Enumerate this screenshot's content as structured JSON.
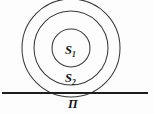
{
  "figure": {
    "background_color": "#fdfdfd",
    "stroke_color": "#3a3a3a",
    "line_color": "#1d1d1d",
    "label_color": "#161616",
    "labels": {
      "inner_region": "S",
      "inner_region_sub": "1",
      "middle_region": "S",
      "middle_region_sub": "2",
      "plane": "П"
    },
    "circles": [
      {
        "name": "outer-circle",
        "cx": 71,
        "cy": 48,
        "r": 49
      },
      {
        "name": "middle-circle",
        "cx": 71,
        "cy": 48,
        "r": 37
      },
      {
        "name": "inner-circle",
        "cx": 71,
        "cy": 48,
        "r": 19
      }
    ],
    "line": {
      "name": "plane-line",
      "x1": 2,
      "y1": 93,
      "x2": 148,
      "y2": 93
    }
  }
}
